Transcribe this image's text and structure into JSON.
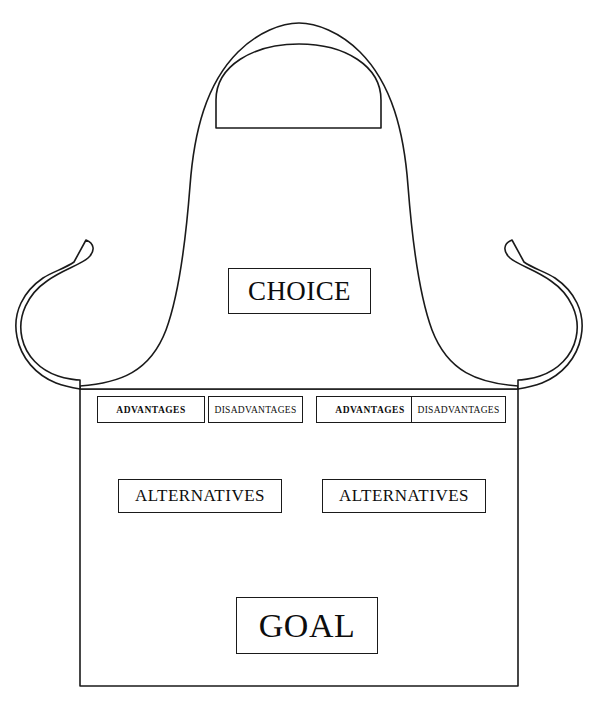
{
  "diagram": {
    "shape": "apron",
    "stroke_color": "#1a1a1a",
    "fill_color": "#ffffff",
    "text_color": "#0d0d0d"
  },
  "boxes": {
    "choice": {
      "label": "CHOICE"
    },
    "goal": {
      "label": "GOAL"
    },
    "alternatives": [
      {
        "label": "ALTERNATIVES"
      },
      {
        "label": "ALTERNATIVES"
      }
    ],
    "evaluations": [
      {
        "label": "ADVANTAGES"
      },
      {
        "label": "DISADVANTAGES"
      },
      {
        "label": "ADVANTAGES"
      },
      {
        "label": "DISADVANTAGES"
      }
    ]
  },
  "apron_parts": {
    "bib": "apron-bib",
    "neck_strap": "neck-strap",
    "skirt": "apron-skirt",
    "left_tie": "left-waist-tie",
    "right_tie": "right-waist-tie"
  }
}
